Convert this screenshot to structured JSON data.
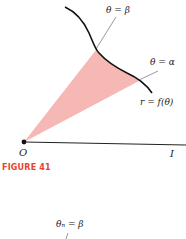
{
  "figure": {
    "caption": "FIGURE 41",
    "caption_color": "#e8432e",
    "shade_color": "#f6b8b4",
    "labels": {
      "theta_beta": "θ = β",
      "theta_alpha": "θ = α",
      "curve": "r = f(θ)",
      "origin": "O",
      "axis_end": "I"
    }
  },
  "next_figure": {
    "label": "θₙ = β"
  }
}
